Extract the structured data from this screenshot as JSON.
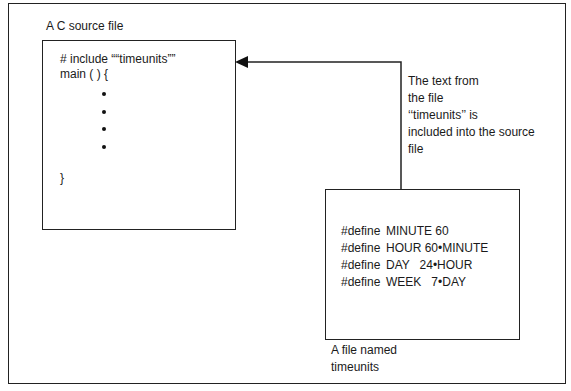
{
  "diagram": {
    "source_file_label": "A C source file",
    "source_code": {
      "include_line": "# include ““timeunits””",
      "main_line": "main ( ) {",
      "ellipsis_dots": 4,
      "closing_brace": "}"
    },
    "annotation": {
      "lines": [
        "The text from",
        "the file",
        "‘‘timeunits’’ is",
        "included into the source",
        "file"
      ]
    },
    "header_file": {
      "defines": [
        {
          "keyword": "#define",
          "body": "MINUTE 60"
        },
        {
          "keyword": "#define",
          "body": "HOUR 60•MINUTE"
        },
        {
          "keyword": "#define",
          "body": "DAY   24•HOUR"
        },
        {
          "keyword": "#define",
          "body": "WEEK   7•DAY"
        }
      ],
      "caption_lines": [
        "A file named",
        "timeunits"
      ]
    },
    "arrow": {
      "from": "header-file-box",
      "to": "source-file-box",
      "style": "filled-triangle-head"
    }
  }
}
